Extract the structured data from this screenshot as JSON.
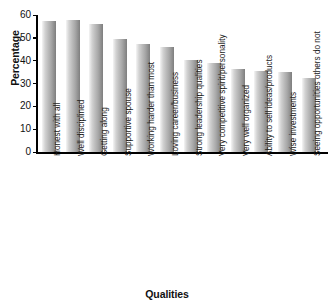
{
  "chart_data": {
    "type": "bar",
    "title": "",
    "xlabel": "Qualities",
    "ylabel": "Percentage",
    "ylim": [
      0,
      60
    ],
    "yticks": [
      0,
      10,
      20,
      30,
      40,
      50,
      60
    ],
    "grid": false,
    "legend": null,
    "categories": [
      "Honest with all",
      "Well disciplined",
      "Getting along",
      "Supportive spouse",
      "Working harder than most",
      "Loving career/business",
      "Strong leadership qualities",
      "Very competitive spirit/personality",
      "Very well organized",
      "Ability to sell ideas/products",
      "Wise investments",
      "Seeing opportunities others do not"
    ],
    "values": [
      57.5,
      58,
      56,
      49.5,
      47.5,
      46,
      40.5,
      39,
      36.5,
      35.5,
      35,
      32.5
    ],
    "bar_color_light": "#e9e9e9",
    "bar_color_dark": "#7e7e7e",
    "axis_color": "#000000"
  }
}
